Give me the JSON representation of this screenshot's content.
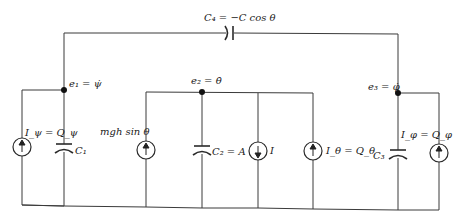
{
  "diagram": {
    "coupling_capacitor": {
      "label": "C₄ = −C cos θ"
    },
    "nodes": [
      {
        "id": "e1",
        "label": "e₁ = ψ̇"
      },
      {
        "id": "e2",
        "label": "e₂ = θ̇"
      },
      {
        "id": "e3",
        "label": "e₃ = φ̇"
      }
    ],
    "branches": [
      {
        "type": "current-source",
        "label": "I_ψ = Q_ψ",
        "direction": "up"
      },
      {
        "type": "capacitor",
        "label": "C₁"
      },
      {
        "type": "current-source",
        "label": "mgh sin θ",
        "direction": "up"
      },
      {
        "type": "capacitor",
        "label": "C₂ = A"
      },
      {
        "type": "current-source",
        "label": "I",
        "direction": "down"
      },
      {
        "type": "current-source",
        "label": "I_θ = Q_θ",
        "direction": "up"
      },
      {
        "type": "capacitor",
        "label": "C₃"
      },
      {
        "type": "current-source",
        "label": "I_φ = Q_φ",
        "direction": "up"
      }
    ]
  }
}
